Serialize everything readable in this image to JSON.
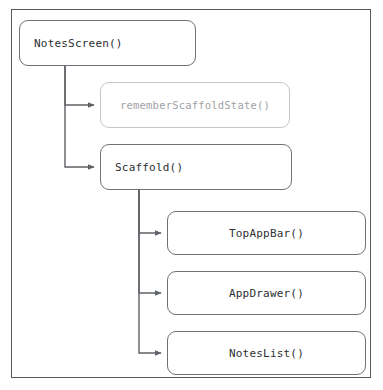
{
  "diagram": {
    "frame": {
      "x": 11,
      "y": 9,
      "width": 360,
      "height": 369
    },
    "colors": {
      "frame_border": "#55585c",
      "node_border_strong": "#6e7176",
      "node_border_faint": "#c3c6ca",
      "text_strong": "#2c2f33",
      "text_faint": "#9ea2a7",
      "connector": "#5f6367",
      "background": "#ffffff"
    },
    "nodes": [
      {
        "id": "notes-screen",
        "label": "NotesScreen()",
        "style": "strong",
        "align": "left",
        "x": 19,
        "y": 20,
        "width": 177,
        "height": 46,
        "font_size": 11
      },
      {
        "id": "remember-scaffold-state",
        "label": "rememberScaffoldState()",
        "style": "faint",
        "align": "center",
        "x": 100,
        "y": 82,
        "width": 190,
        "height": 46,
        "font_size": 10.5
      },
      {
        "id": "scaffold",
        "label": "Scaffold()",
        "style": "strong",
        "align": "left",
        "x": 100,
        "y": 144,
        "width": 192,
        "height": 46,
        "font_size": 11
      },
      {
        "id": "top-app-bar",
        "label": "TopAppBar()",
        "style": "strong",
        "align": "center",
        "x": 167,
        "y": 211,
        "width": 199,
        "height": 44,
        "font_size": 11
      },
      {
        "id": "app-drawer",
        "label": "AppDrawer()",
        "style": "strong",
        "align": "center",
        "x": 167,
        "y": 271,
        "width": 199,
        "height": 44,
        "font_size": 11
      },
      {
        "id": "notes-list",
        "label": "NotesList()",
        "style": "strong",
        "align": "center",
        "x": 167,
        "y": 331,
        "width": 199,
        "height": 44,
        "font_size": 11
      }
    ],
    "connectors": [
      {
        "id": "notes-screen-to-remember-scaffold-state",
        "from": "notes-screen",
        "to": "remember-scaffold-state",
        "path": "M 65 66 L 65 105 L 94 105",
        "arrow_at": {
          "x": 99,
          "y": 105
        }
      },
      {
        "id": "notes-screen-to-scaffold",
        "from": "notes-screen",
        "to": "scaffold",
        "path": "M 65 66 L 65 167 L 94 167",
        "arrow_at": {
          "x": 99,
          "y": 167
        }
      },
      {
        "id": "scaffold-to-top-app-bar",
        "from": "scaffold",
        "to": "top-app-bar",
        "path": "M 139 190 L 139 233 L 161 233",
        "arrow_at": {
          "x": 166,
          "y": 233
        }
      },
      {
        "id": "scaffold-to-app-drawer",
        "from": "scaffold",
        "to": "app-drawer",
        "path": "M 139 190 L 139 293 L 161 293",
        "arrow_at": {
          "x": 166,
          "y": 293
        }
      },
      {
        "id": "scaffold-to-notes-list",
        "from": "scaffold",
        "to": "notes-list",
        "path": "M 139 190 L 139 353 L 161 353",
        "arrow_at": {
          "x": 166,
          "y": 353
        }
      }
    ]
  }
}
